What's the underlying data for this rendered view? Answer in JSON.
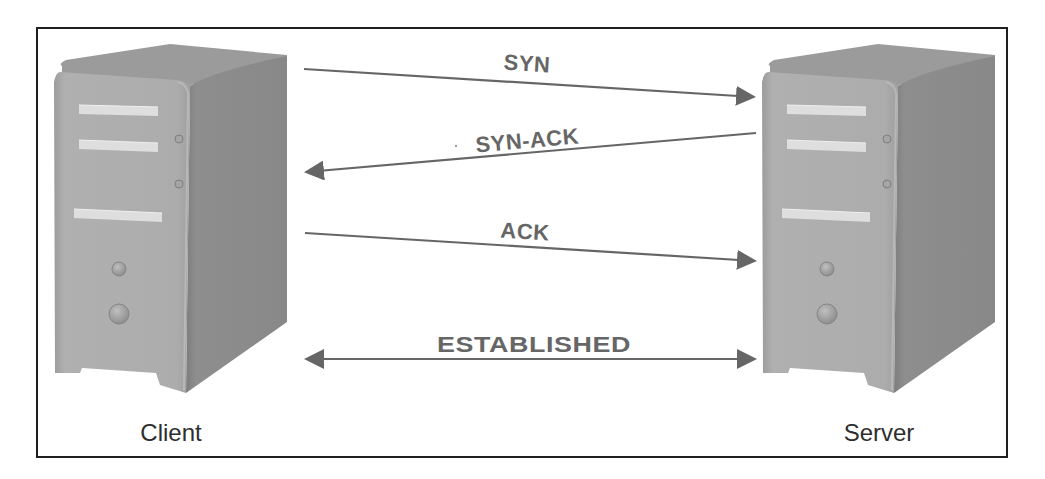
{
  "diagram": {
    "nodes": {
      "client": {
        "label": "Client",
        "icon": "computer-tower-icon"
      },
      "server": {
        "label": "Server",
        "icon": "computer-tower-icon"
      }
    },
    "messages": [
      {
        "label": "SYN",
        "from": "Client",
        "to": "Server",
        "direction": "right"
      },
      {
        "label": "SYN-ACK",
        "from": "Server",
        "to": "Client",
        "direction": "left"
      },
      {
        "label": "ACK",
        "from": "Client",
        "to": "Server",
        "direction": "right"
      },
      {
        "label": "ESTABLISHED",
        "from": "Client",
        "to": "Server",
        "direction": "both"
      }
    ],
    "colors": {
      "arrow": "#666666",
      "label": "#666666",
      "frame": "#1f1f1f",
      "tower_front": "#a9a9a9",
      "tower_side": "#8c8c8c",
      "tower_top": "#9a9a9a",
      "bay": "#dcdcdc"
    }
  }
}
